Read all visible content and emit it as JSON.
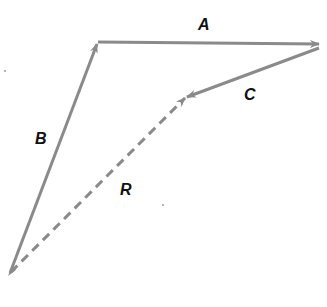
{
  "diagram": {
    "type": "vector-addition",
    "stroke_color": "#8a8a8a",
    "label_color": "#111111",
    "vectors": [
      {
        "name": "B",
        "label": "B",
        "style": "solid",
        "from": [
          10,
          273
        ],
        "to": [
          98,
          42
        ]
      },
      {
        "name": "A",
        "label": "A",
        "style": "solid",
        "from": [
          98,
          42
        ],
        "to": [
          320,
          44
        ]
      },
      {
        "name": "C",
        "label": "C",
        "style": "solid",
        "from": [
          319,
          48
        ],
        "to": [
          186,
          97
        ]
      },
      {
        "name": "R",
        "label": "R",
        "style": "dashed",
        "from": [
          10,
          273
        ],
        "to": [
          186,
          97
        ]
      }
    ],
    "labels": {
      "A": "A",
      "B": "B",
      "C": "C",
      "R": "R"
    }
  }
}
